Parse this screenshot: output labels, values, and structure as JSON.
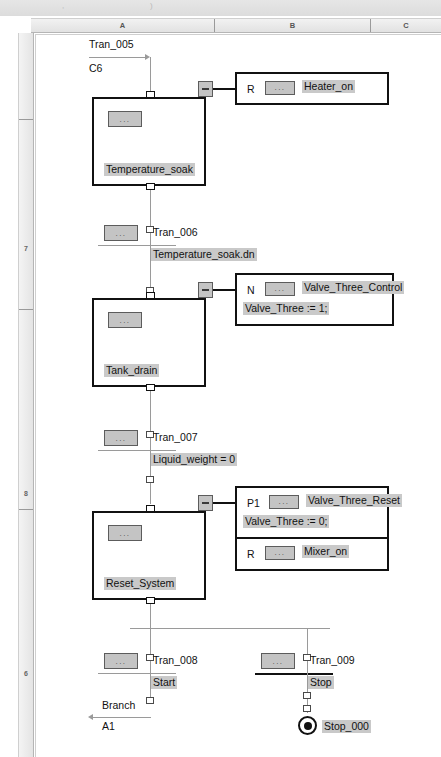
{
  "window": {
    "ruler_columns": [
      "A",
      "B",
      "C"
    ],
    "ruler_rows": [
      "7",
      "8",
      "6"
    ]
  },
  "chart": {
    "entry": {
      "transition_label": "Tran_005",
      "source_ref": "C6"
    },
    "steps": [
      {
        "name": "Temperature_soak",
        "chip": "...",
        "collapse": "-",
        "actions": [
          {
            "qualifier": "R",
            "chip": "...",
            "name": "Heater_on",
            "body": ""
          }
        ]
      },
      {
        "name": "Tank_drain",
        "chip": "...",
        "collapse": "-",
        "actions": [
          {
            "qualifier": "N",
            "chip": "...",
            "name": "Valve_Three_Control",
            "body": "Valve_Three := 1;"
          }
        ]
      },
      {
        "name": "Reset_System",
        "chip": "...",
        "collapse": "-",
        "actions": [
          {
            "qualifier": "P1",
            "chip": "...",
            "name": "Valve_Three_Reset",
            "body": "Valve_Three := 0;"
          },
          {
            "qualifier": "R",
            "chip": "...",
            "name": "Mixer_on",
            "body": ""
          }
        ]
      }
    ],
    "transitions": [
      {
        "label": "Tran_006",
        "condition": "Temperature_soak.dn",
        "chip": "..."
      },
      {
        "label": "Tran_007",
        "condition": "Liquid_weight = 0",
        "chip": "..."
      },
      {
        "label": "Tran_008",
        "condition": "Start",
        "chip": "..."
      },
      {
        "label": "Tran_009",
        "condition": "Stop",
        "chip": "..."
      }
    ],
    "branch": {
      "label": "Branch",
      "target_ref": "A1"
    },
    "terminal": {
      "name": "Stop_000"
    }
  }
}
